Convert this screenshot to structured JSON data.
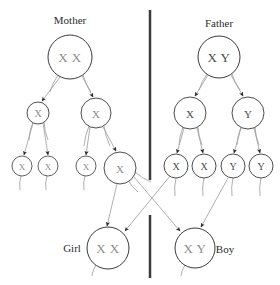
{
  "figure": {
    "title_mother": "Mother",
    "title_father": "Father",
    "label_girl": "Girl",
    "label_boy": "Boy",
    "divider_color": "#3a3a3a",
    "node_stroke_color": "#3a3a3a",
    "node_fill_color": "#ffffff",
    "edge_color": "#9a9a9a",
    "text_gray": "#8c8c8c",
    "text_dark": "#4a4a4a",
    "caption_color": "#2b2b2b"
  },
  "captions": [
    {
      "id": "caption-mother",
      "text": "Mother",
      "x": 70,
      "y": 20,
      "size": 11
    },
    {
      "id": "caption-father",
      "text": "Father",
      "x": 219,
      "y": 23,
      "size": 11
    },
    {
      "id": "caption-girl",
      "text": "Girl",
      "x": 72,
      "y": 248,
      "size": 11
    },
    {
      "id": "caption-boy",
      "text": "Boy",
      "x": 225,
      "y": 249,
      "size": 11
    }
  ],
  "nodes": [
    {
      "id": "mother",
      "name": "mother-node",
      "label": "X X",
      "cx": 70,
      "cy": 57,
      "r": 22,
      "size": 13,
      "tone": "gray",
      "stroke": 1.0
    },
    {
      "id": "father",
      "name": "father-node",
      "label": "X Y",
      "cx": 219,
      "cy": 57,
      "r": 21,
      "size": 13,
      "tone": "dark",
      "stroke": 1.0
    },
    {
      "id": "m-gen2-left",
      "name": "mother-gamete-x-left",
      "label": "X",
      "cx": 38,
      "cy": 113,
      "r": 11,
      "size": 10,
      "tone": "gray",
      "stroke": 0.9
    },
    {
      "id": "m-gen2-right",
      "name": "mother-gamete-x-right",
      "label": "X",
      "cx": 96,
      "cy": 113,
      "r": 15,
      "size": 11,
      "tone": "gray",
      "stroke": 0.9
    },
    {
      "id": "f-gen2-left",
      "name": "father-gamete-x",
      "label": "X",
      "cx": 190,
      "cy": 113,
      "r": 16,
      "size": 11,
      "tone": "dark",
      "stroke": 0.9
    },
    {
      "id": "f-gen2-right",
      "name": "father-gamete-y",
      "label": "Y",
      "cx": 248,
      "cy": 113,
      "r": 16,
      "size": 11,
      "tone": "dark",
      "stroke": 0.9
    },
    {
      "id": "m-gen3-1",
      "name": "mother-egg-x-1",
      "label": "X",
      "cx": 22,
      "cy": 166,
      "r": 10,
      "size": 9,
      "tone": "gray",
      "stroke": 0.8
    },
    {
      "id": "m-gen3-2",
      "name": "mother-egg-x-2",
      "label": "X",
      "cx": 48,
      "cy": 166,
      "r": 10,
      "size": 9,
      "tone": "gray",
      "stroke": 0.8
    },
    {
      "id": "m-gen3-3",
      "name": "mother-egg-x-3",
      "label": "X",
      "cx": 86,
      "cy": 166,
      "r": 10,
      "size": 9,
      "tone": "gray",
      "stroke": 0.8
    },
    {
      "id": "m-gen3-4",
      "name": "mother-egg-x-4",
      "label": "X",
      "cx": 120,
      "cy": 168,
      "r": 16,
      "size": 11,
      "tone": "gray",
      "stroke": 0.9
    },
    {
      "id": "f-gen3-1",
      "name": "father-sperm-x-1",
      "label": "X",
      "cx": 176,
      "cy": 166,
      "r": 12,
      "size": 10,
      "tone": "dark",
      "stroke": 0.9
    },
    {
      "id": "f-gen3-2",
      "name": "father-sperm-x-2",
      "label": "X",
      "cx": 204,
      "cy": 166,
      "r": 12,
      "size": 10,
      "tone": "dark",
      "stroke": 0.9
    },
    {
      "id": "f-gen3-3",
      "name": "father-sperm-y-1",
      "label": "Y",
      "cx": 233,
      "cy": 166,
      "r": 12,
      "size": 10,
      "tone": "dark",
      "stroke": 0.9
    },
    {
      "id": "f-gen3-4",
      "name": "father-sperm-y-2",
      "label": "Y",
      "cx": 261,
      "cy": 166,
      "r": 12,
      "size": 10,
      "tone": "dark",
      "stroke": 0.9
    },
    {
      "id": "girl",
      "name": "girl-zygote-node",
      "label": "X X",
      "cx": 108,
      "cy": 248,
      "r": 21,
      "size": 13,
      "tone": "gray",
      "stroke": 1.0
    },
    {
      "id": "boy",
      "name": "boy-zygote-node",
      "label": "X Y",
      "cx": 195,
      "cy": 248,
      "r": 20,
      "size": 13,
      "tone": "gray",
      "stroke": 1.0
    }
  ],
  "edges": [
    {
      "name": "edge-mother-to-gamete-left",
      "x1": 60,
      "y1": 77,
      "x2": 42,
      "y2": 101,
      "arrow": true
    },
    {
      "name": "edge-mother-to-gamete-right",
      "x1": 82,
      "y1": 76,
      "x2": 93,
      "y2": 97,
      "arrow": true
    },
    {
      "name": "edge-father-to-gamete-x",
      "x1": 208,
      "y1": 75,
      "x2": 195,
      "y2": 96,
      "arrow": true
    },
    {
      "name": "edge-father-to-gamete-y",
      "x1": 231,
      "y1": 75,
      "x2": 243,
      "y2": 96,
      "arrow": true
    },
    {
      "name": "edge-mgam-left-to-egg-1",
      "x1": 33,
      "y1": 123,
      "x2": 24,
      "y2": 155,
      "arrow": true
    },
    {
      "name": "edge-mgam-left-to-egg-2",
      "x1": 43,
      "y1": 123,
      "x2": 48,
      "y2": 155,
      "arrow": true
    },
    {
      "name": "edge-mgam-right-to-egg-3",
      "x1": 90,
      "y1": 127,
      "x2": 86,
      "y2": 155,
      "arrow": true
    },
    {
      "name": "edge-mgam-right-to-egg-4",
      "x1": 103,
      "y1": 127,
      "x2": 116,
      "y2": 151,
      "arrow": true
    },
    {
      "name": "edge-fgam-x-to-sperm-1",
      "x1": 184,
      "y1": 128,
      "x2": 177,
      "y2": 153,
      "arrow": true
    },
    {
      "name": "edge-fgam-x-to-sperm-2",
      "x1": 197,
      "y1": 128,
      "x2": 203,
      "y2": 153,
      "arrow": true
    },
    {
      "name": "edge-fgam-y-to-sperm-1",
      "x1": 241,
      "y1": 128,
      "x2": 234,
      "y2": 153,
      "arrow": true
    },
    {
      "name": "edge-fgam-y-to-sperm-2",
      "x1": 254,
      "y1": 128,
      "x2": 260,
      "y2": 153,
      "arrow": true
    },
    {
      "name": "edge-egg-to-girl",
      "x1": 117,
      "y1": 184,
      "x2": 107,
      "y2": 226,
      "arrow": true
    },
    {
      "name": "edge-sperm-x-to-girl",
      "x1": 170,
      "y1": 176,
      "x2": 125,
      "y2": 231,
      "arrow": true
    },
    {
      "name": "edge-egg-to-boy",
      "x1": 134,
      "y1": 177,
      "x2": 180,
      "y2": 231,
      "arrow": true
    },
    {
      "name": "edge-sperm-y-to-boy",
      "x1": 228,
      "y1": 178,
      "x2": 201,
      "y2": 227,
      "arrow": true
    }
  ],
  "tails": [
    {
      "name": "tail-mother-left",
      "x1": 58,
      "y1": 75,
      "x2": 50,
      "y2": 92
    },
    {
      "name": "tail-mother-right",
      "x1": 83,
      "y1": 75,
      "x2": 91,
      "y2": 92
    },
    {
      "name": "tail-father-left",
      "x1": 207,
      "y1": 74,
      "x2": 199,
      "y2": 90
    },
    {
      "name": "tail-father-right",
      "x1": 232,
      "y1": 74,
      "x2": 240,
      "y2": 90
    },
    {
      "name": "tail-mgam-left-a",
      "x1": 33,
      "y1": 122,
      "x2": 29,
      "y2": 140
    },
    {
      "name": "tail-mgam-left-b",
      "x1": 44,
      "y1": 122,
      "x2": 48,
      "y2": 140
    },
    {
      "name": "tail-mgam-right-a",
      "x1": 89,
      "y1": 126,
      "x2": 84,
      "y2": 146
    },
    {
      "name": "tail-mgam-right-b",
      "x1": 104,
      "y1": 126,
      "x2": 110,
      "y2": 146
    },
    {
      "name": "tail-fgam-x-a",
      "x1": 183,
      "y1": 127,
      "x2": 179,
      "y2": 145
    },
    {
      "name": "tail-fgam-x-b",
      "x1": 198,
      "y1": 127,
      "x2": 202,
      "y2": 145
    },
    {
      "name": "tail-fgam-y-a",
      "x1": 241,
      "y1": 127,
      "x2": 237,
      "y2": 145
    },
    {
      "name": "tail-fgam-y-b",
      "x1": 255,
      "y1": 127,
      "x2": 259,
      "y2": 145
    },
    {
      "name": "tail-egg-1",
      "x1": 21,
      "y1": 176,
      "x2": 20,
      "y2": 190
    },
    {
      "name": "tail-egg-2",
      "x1": 47,
      "y1": 176,
      "x2": 46,
      "y2": 190
    },
    {
      "name": "tail-egg-3",
      "x1": 85,
      "y1": 176,
      "x2": 84,
      "y2": 190
    },
    {
      "name": "tail-egg-4a",
      "x1": 128,
      "y1": 180,
      "x2": 138,
      "y2": 192
    },
    {
      "name": "tail-egg-4b",
      "x1": 135,
      "y1": 172,
      "x2": 151,
      "y2": 182
    },
    {
      "name": "tail-sperm-1",
      "x1": 176,
      "y1": 178,
      "x2": 175,
      "y2": 196
    },
    {
      "name": "tail-sperm-2",
      "x1": 204,
      "y1": 178,
      "x2": 203,
      "y2": 196
    },
    {
      "name": "tail-sperm-3",
      "x1": 233,
      "y1": 178,
      "x2": 232,
      "y2": 196
    },
    {
      "name": "tail-sperm-4",
      "x1": 261,
      "y1": 178,
      "x2": 260,
      "y2": 196
    },
    {
      "name": "tail-girl-a",
      "x1": 96,
      "y1": 265,
      "x2": 92,
      "y2": 276
    },
    {
      "name": "tail-boy-a",
      "x1": 185,
      "y1": 265,
      "x2": 181,
      "y2": 276
    }
  ],
  "divider": {
    "name": "center-divider",
    "x": 150,
    "segments": [
      {
        "y1": 10,
        "y2": 180
      },
      {
        "y1": 215,
        "y2": 278
      }
    ],
    "width": 2.5
  }
}
